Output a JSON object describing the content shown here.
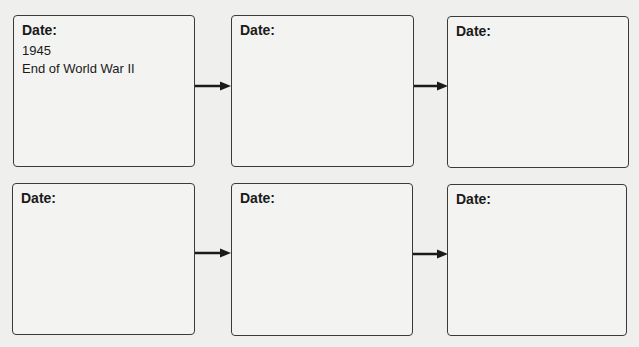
{
  "organizer": {
    "rows": [
      {
        "boxes": [
          {
            "label": "Date:",
            "lines": [
              "1945",
              "End of World War II"
            ]
          },
          {
            "label": "Date:",
            "lines": []
          },
          {
            "label": "Date:",
            "lines": []
          }
        ]
      },
      {
        "boxes": [
          {
            "label": "Date:",
            "lines": []
          },
          {
            "label": "Date:",
            "lines": []
          },
          {
            "label": "Date:",
            "lines": []
          }
        ]
      }
    ],
    "colors": {
      "border": "#3a3a3a",
      "arrow": "#1a1a1a",
      "background": "#efefed"
    }
  }
}
